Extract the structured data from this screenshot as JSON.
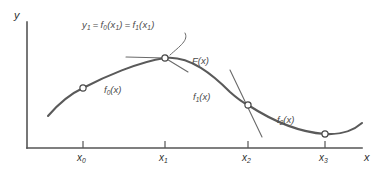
{
  "figure": {
    "type": "diagram",
    "background_color": "#ffffff",
    "curve_color": "#5a5a5a",
    "axis_color": "#555555",
    "text_color": "#3d3d3d",
    "marker_fill": "#ffffff"
  },
  "axes": {
    "y_label": "y",
    "x_label": "x",
    "origin_px": {
      "x": 27,
      "y": 148
    },
    "x_axis_end_px": {
      "x": 362,
      "y": 148
    },
    "y_axis_top_px": {
      "x": 27,
      "y": 22
    },
    "ticks": [
      {
        "id": "x0",
        "label_base": "x",
        "label_sub": "0",
        "px": 83
      },
      {
        "id": "x1",
        "label_base": "x",
        "label_sub": "1",
        "px": 165
      },
      {
        "id": "x2",
        "label_base": "x",
        "label_sub": "2",
        "px": 248
      },
      {
        "id": "x3",
        "label_base": "x",
        "label_sub": "3",
        "px": 325
      }
    ]
  },
  "annotations": {
    "node_value": {
      "text": "y1 = f0(x1) = f1(x1)",
      "parts": {
        "y": "y",
        "y_sub": "1",
        "eq1": "=",
        "f0": "f",
        "f0_sub": "0",
        "arg0_open": "(x",
        "arg0_sub": "1",
        "arg0_close": ")",
        "eq2": "=",
        "f1": "f",
        "f1_sub": "1",
        "arg1_open": "(x",
        "arg1_sub": "1",
        "arg1_close": ")"
      },
      "position_px": {
        "x": 82,
        "y": 20
      }
    },
    "composite_label": {
      "text": "F(x)",
      "base": "F",
      "arg": "(x)",
      "position_px": {
        "x": 192,
        "y": 56
      }
    },
    "segment_labels": [
      {
        "id": "f0",
        "base": "f",
        "sub": "0",
        "arg": "(x)",
        "position_px": {
          "x": 104,
          "y": 85
        }
      },
      {
        "id": "f1",
        "base": "f",
        "sub": "1",
        "arg": "(x)",
        "position_px": {
          "x": 193,
          "y": 92
        }
      },
      {
        "id": "f2",
        "base": "f",
        "sub": "2",
        "arg": "(x)",
        "position_px": {
          "x": 277,
          "y": 115
        }
      }
    ]
  },
  "knots": [
    {
      "id": "node-x0",
      "px": {
        "x": 83,
        "y": 88
      },
      "shape": "open-circle"
    },
    {
      "id": "node-x1",
      "px": {
        "x": 165,
        "y": 58
      },
      "shape": "open-circle"
    },
    {
      "id": "node-x2",
      "px": {
        "x": 248,
        "y": 105
      },
      "shape": "open-circle"
    },
    {
      "id": "node-x3",
      "px": {
        "x": 325,
        "y": 134
      },
      "shape": "open-circle"
    }
  ]
}
